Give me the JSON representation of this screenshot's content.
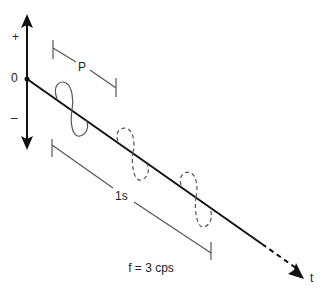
{
  "diagram": {
    "type": "wave-propagation",
    "y_axis": {
      "plus_label": "+",
      "zero_label": "0",
      "minus_label": "–"
    },
    "time_axis": {
      "label": "t"
    },
    "period_bracket": {
      "label": "P"
    },
    "duration_bracket": {
      "label": "1s"
    },
    "frequency_caption": "f = 3 cps",
    "cycles": [
      {
        "index": 1,
        "style": "solid"
      },
      {
        "index": 2,
        "style": "dashed"
      },
      {
        "index": 3,
        "style": "dashed"
      }
    ],
    "colors": {
      "axis": "#111111",
      "bracket": "#555555",
      "wave": "#555555",
      "text": "#222222"
    }
  }
}
